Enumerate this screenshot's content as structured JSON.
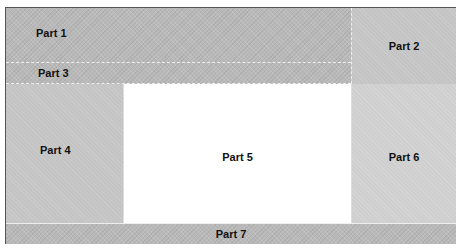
{
  "diagram": {
    "type": "page-layout",
    "parts": [
      {
        "id": "p1",
        "label": "Part 1"
      },
      {
        "id": "p2",
        "label": "Part 2"
      },
      {
        "id": "p3",
        "label": "Part 3"
      },
      {
        "id": "p4",
        "label": "Part 4"
      },
      {
        "id": "p5",
        "label": "Part 5"
      },
      {
        "id": "p6",
        "label": "Part 6"
      },
      {
        "id": "p7",
        "label": "Part 7"
      }
    ],
    "colors": {
      "dark_panel": "#b9b9b9",
      "light_panel": "#cfcfcf",
      "center_panel": "#ffffff",
      "border": "#555555"
    }
  }
}
